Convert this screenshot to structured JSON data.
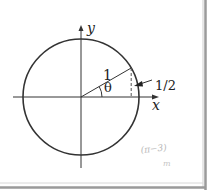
{
  "diagram": {
    "type": "unit-circle",
    "labels": {
      "y_axis": "y",
      "x_axis": "x",
      "radius": "1",
      "angle": "θ",
      "opposite_side": "1/2",
      "handwritten_note_1": "(π−3)",
      "handwritten_note_2": "m"
    },
    "colors": {
      "stroke": "#333333",
      "border": "#999999",
      "handwriting": "#b8b8b8",
      "background": "#ffffff"
    },
    "geometry": {
      "center": [
        81,
        97
      ],
      "radius_px": 58,
      "angle_deg": 30
    }
  }
}
